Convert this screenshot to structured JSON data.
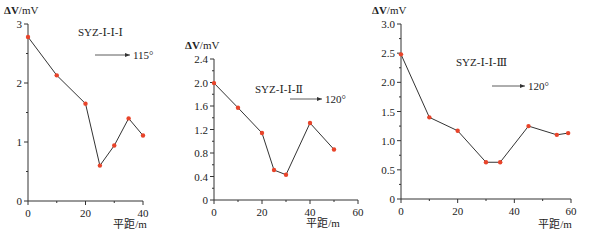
{
  "chart_data": [
    {
      "type": "line",
      "title": "SYZ-Ⅰ-Ⅰ-Ⅰ",
      "annotation": "115°",
      "xlabel": "平距/m",
      "ylabel": "ΔV/mV",
      "x": [
        0,
        10,
        20,
        25,
        30,
        35,
        40
      ],
      "values": [
        2.78,
        2.13,
        1.65,
        0.6,
        0.94,
        1.4,
        1.11
      ],
      "xlim": [
        0,
        40
      ],
      "ylim": [
        0,
        3
      ],
      "xticks": [
        "0",
        "20",
        "40"
      ],
      "yticks": [
        "0",
        "1",
        "2",
        "3"
      ],
      "grid": false
    },
    {
      "type": "line",
      "title": "SYZ-Ⅰ-Ⅰ-Ⅱ",
      "annotation": "120°",
      "xlabel": "平距/m",
      "ylabel": "ΔV/mV",
      "x": [
        0,
        10,
        20,
        25,
        30,
        40,
        50
      ],
      "values": [
        1.99,
        1.57,
        1.14,
        0.51,
        0.43,
        1.31,
        0.86
      ],
      "xlim": [
        0,
        60
      ],
      "ylim": [
        0,
        2.4
      ],
      "xticks": [
        "0",
        "20",
        "40",
        "60"
      ],
      "yticks": [
        "0",
        "0.4",
        "0.8",
        "1.2",
        "1.6",
        "2.0",
        "2.4"
      ],
      "grid": false
    },
    {
      "type": "line",
      "title": "SYZ-Ⅰ-Ⅰ-Ⅲ",
      "annotation": "120°",
      "xlabel": "平距/m",
      "ylabel": "ΔV/mV",
      "x": [
        0,
        10,
        20,
        30,
        35,
        45,
        55,
        59
      ],
      "values": [
        2.48,
        1.4,
        1.17,
        0.63,
        0.63,
        1.25,
        1.1,
        1.13
      ],
      "xlim": [
        0,
        60
      ],
      "ylim": [
        0,
        3.0
      ],
      "xticks": [
        "0",
        "20",
        "40",
        "60"
      ],
      "yticks": [
        "0",
        "0.5",
        "1.0",
        "1.5",
        "2.0",
        "2.5",
        "3.0"
      ],
      "grid": false
    }
  ],
  "style": {
    "line_color": "#333333",
    "marker_color": "#e8442a"
  }
}
